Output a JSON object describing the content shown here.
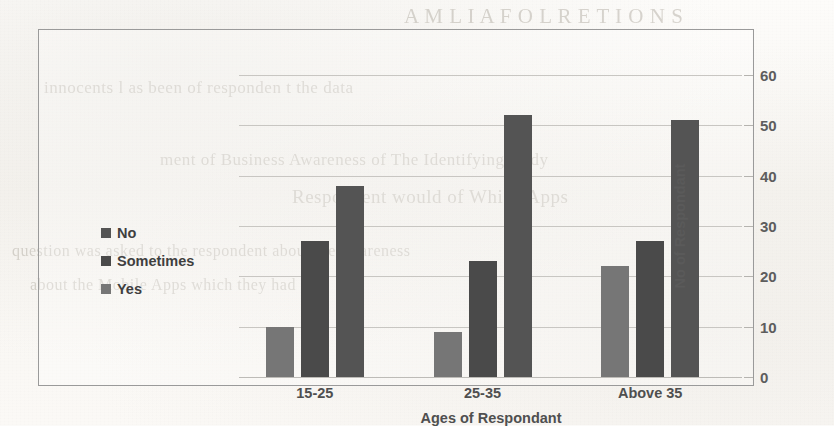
{
  "chart_data": {
    "type": "bar",
    "title": "",
    "xlabel": "Ages of Respondant",
    "ylabel": "No of Respondant",
    "categories": [
      "15-25",
      "25-35",
      "Above 35"
    ],
    "series": [
      {
        "name": "Yes",
        "color": "#767676",
        "values": [
          10,
          9,
          22
        ]
      },
      {
        "name": "Sometimes",
        "color": "#4a4a4a",
        "values": [
          27,
          23,
          27
        ]
      },
      {
        "name": "No",
        "color": "#545454",
        "values": [
          38,
          52,
          51
        ]
      }
    ],
    "legend_order": [
      "No",
      "Sometimes",
      "Yes"
    ],
    "legend_position": "left",
    "ylim": [
      0,
      60
    ],
    "yticks": [
      0,
      10,
      20,
      30,
      40,
      50,
      60
    ],
    "ytick_labels": [
      "0",
      "10",
      "20",
      "30",
      "40",
      "50",
      "60"
    ],
    "y_axis_side": "right",
    "grid": true,
    "gridline_color": "#c8c6c2",
    "frame_border_color": "#9a9a9a",
    "background": "#fbfaf8"
  },
  "legend": {
    "items": [
      {
        "label": "No",
        "swatch": "#545454"
      },
      {
        "label": "Sometimes",
        "swatch": "#4a4a4a"
      },
      {
        "label": "Yes",
        "swatch": "#767676"
      }
    ]
  },
  "ghost_text": {
    "lines": [
      "A M L I A  F  O L R E T I O N  S",
      "innocents  l  as  been  of  responden  t  the  data",
      "ment  of  Business  Awareness  of  The  Identifying  study",
      "Respondent  would  of  Which  Apps",
      "question  was  asked  to  the  respondent  about  the  awareness",
      "about  the  Mobile  Apps  which  they  had"
    ]
  }
}
